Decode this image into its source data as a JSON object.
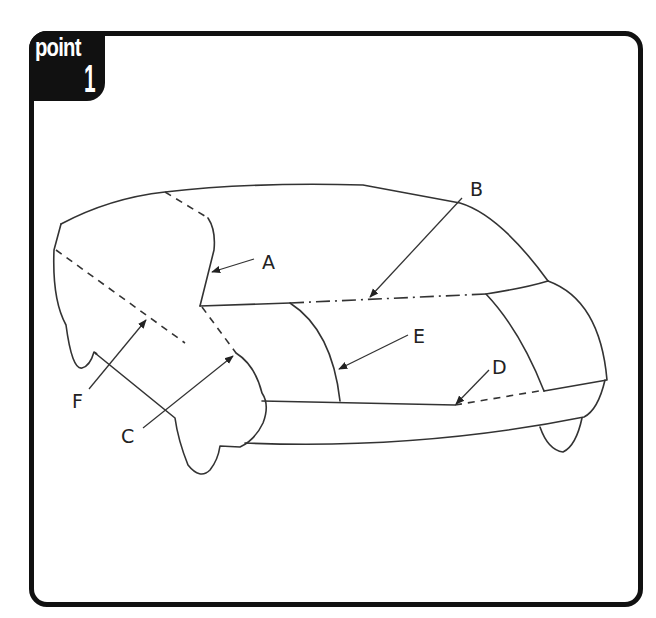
{
  "badge": {
    "word": "point",
    "number": "1"
  },
  "diagram": {
    "labels": [
      {
        "id": "A",
        "text": "A"
      },
      {
        "id": "B",
        "text": "B"
      },
      {
        "id": "C",
        "text": "C"
      },
      {
        "id": "D",
        "text": "D"
      },
      {
        "id": "E",
        "text": "E"
      },
      {
        "id": "F",
        "text": "F"
      }
    ]
  },
  "colors": {
    "frame": "#111111",
    "line": "#333333",
    "background": "#ffffff"
  }
}
